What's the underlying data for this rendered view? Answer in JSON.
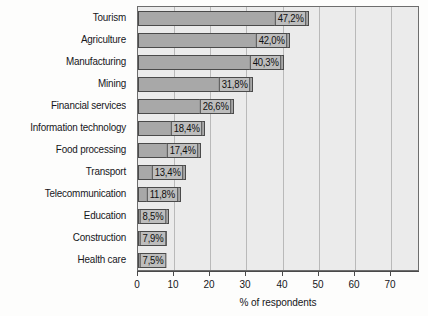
{
  "chart_data": {
    "type": "bar",
    "orientation": "horizontal",
    "title": "",
    "xlabel": "% of respondents",
    "ylabel": "",
    "xlim": [
      0,
      78
    ],
    "xticks": [
      0,
      10,
      20,
      30,
      40,
      50,
      60,
      70
    ],
    "xtick_labels": [
      "0",
      "10",
      "20",
      "30",
      "40",
      "50",
      "60",
      "70"
    ],
    "grid": true,
    "grid_axis": "x",
    "legend": false,
    "decimal_separator": ",",
    "value_suffix": "%",
    "categories": [
      "Tourism",
      "Agriculture",
      "Manufacturing",
      "Mining",
      "Financial services",
      "Information technology",
      "Food processing",
      "Transport",
      "Telecommunication",
      "Education",
      "Construction",
      "Health care"
    ],
    "values": [
      47.2,
      42.0,
      40.3,
      31.8,
      26.6,
      18.4,
      17.4,
      13.4,
      11.8,
      8.5,
      7.9,
      7.5
    ],
    "value_labels": [
      "47,2%",
      "42,0%",
      "40,3%",
      "31,8%",
      "26,6%",
      "18,4%",
      "17,4%",
      "13,4%",
      "11,8%",
      "8,5%",
      "7,9%",
      "7,5%"
    ],
    "colors": {
      "bar_fill": "#a8a8a8",
      "bar_border": "#4a4a4a",
      "plot_background": "#ebebeb",
      "gridline": "#b9b9b9",
      "label_box_fill": "#bdbdbd",
      "text": "#16161a"
    }
  }
}
